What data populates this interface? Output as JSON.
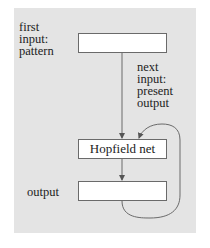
{
  "diagram": {
    "labels": {
      "first_input": [
        "first",
        "input:",
        "pattern"
      ],
      "next_input": [
        "next",
        "input:",
        "present",
        "output"
      ],
      "output": "output"
    },
    "boxes": {
      "input_box": "",
      "hopfield_box": "Hopfield net",
      "output_box": ""
    },
    "colors": {
      "panel": "#e4e4e4",
      "box_fill": "#ffffff",
      "stroke": "#6a6a6a"
    }
  }
}
